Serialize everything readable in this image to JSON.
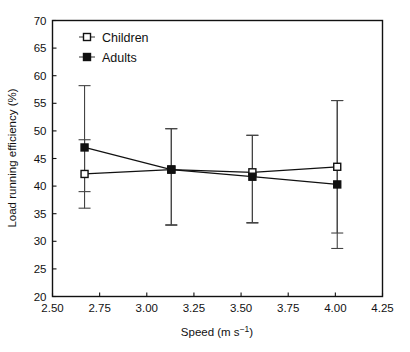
{
  "chart_data": {
    "type": "line",
    "title": "",
    "subtitle": "",
    "xlabel": "Speed (m s−1)",
    "ylabel": "Load running efficiency (%)",
    "xlim": [
      2.5,
      4.25
    ],
    "ylim": [
      20,
      70
    ],
    "xticks": [
      "2.50",
      "2.75",
      "3.00",
      "3.25",
      "3.50",
      "3.75",
      "4.00",
      "4.25"
    ],
    "xtick_values": [
      2.5,
      2.75,
      3.0,
      3.25,
      3.5,
      3.75,
      4.0,
      4.25
    ],
    "yticks": [
      "20",
      "25",
      "30",
      "35",
      "40",
      "45",
      "50",
      "55",
      "60",
      "65",
      "70"
    ],
    "ytick_values": [
      20,
      25,
      30,
      35,
      40,
      45,
      50,
      55,
      60,
      65,
      70
    ],
    "grid": false,
    "legend_position": "top-left-inside",
    "error_bars": "symmetric vertical with caps",
    "x": [
      2.67,
      3.13,
      3.56,
      4.01
    ],
    "series": [
      {
        "name": "Children",
        "marker": "open-square",
        "values": [
          42.2,
          43.0,
          42.5,
          43.5
        ],
        "err_low": [
          36.0,
          32.9,
          33.3,
          31.5
        ],
        "err_high": [
          48.4,
          50.4,
          49.2,
          55.5
        ]
      },
      {
        "name": "Adults",
        "marker": "filled-square",
        "values": [
          47.0,
          43.0,
          41.7,
          40.3
        ],
        "err_low": [
          39.0,
          33.0,
          33.4,
          28.7
        ],
        "err_high": [
          58.2,
          50.4,
          49.2,
          55.5
        ]
      }
    ],
    "annotations": []
  },
  "legend": {
    "items": [
      {
        "label": "Children",
        "marker": "open-square"
      },
      {
        "label": "Adults",
        "marker": "filled-square"
      }
    ]
  },
  "axes": {
    "x_title": "Speed (m s−1)",
    "x_title_base": "Speed (m s",
    "x_title_exponent": "−1",
    "x_title_close": ")",
    "y_title": "Load running efficiency (%)"
  },
  "caption": {
    "text": ""
  },
  "colors": {
    "foreground": "#111111",
    "errorbar": "#444444",
    "background": "#ffffff"
  }
}
